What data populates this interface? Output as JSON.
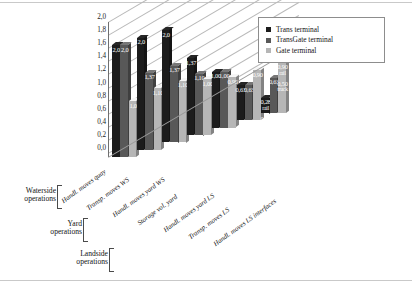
{
  "chart_data": {
    "type": "bar",
    "title": "",
    "xlabel": "",
    "ylabel": "",
    "ylim": [
      0.0,
      2.0
    ],
    "ytick_labels": [
      "2,0",
      "1,8",
      "1,6",
      "1,4",
      "1,2",
      "1,0",
      "0,8",
      "0,6",
      "0,4",
      "0,2",
      "0,0"
    ],
    "ytick_values": [
      2.0,
      1.8,
      1.6,
      1.4,
      1.2,
      1.0,
      0.8,
      0.6,
      0.4,
      0.2,
      0.0
    ],
    "grid": true,
    "legend_position": "top-right",
    "categories": [
      "Handl. moves quay",
      "Transp. moves WS",
      "Handl. moves yard WS",
      "Storage vol. yard",
      "Handl. moves yard LS",
      "Transp. moves LS",
      "Handl. moves LS interfaces"
    ],
    "series": [
      {
        "name": "Trans terminal",
        "color": "#1c1c1c",
        "values": [
          2.0,
          2.0,
          2.0,
          1.37,
          1.0,
          0.63,
          0.28
        ],
        "labels": [
          "2,0",
          "2,0",
          "2,0",
          "1,37",
          "1,00",
          "0,63",
          "0,28"
        ],
        "sublabels": [
          "",
          "",
          "",
          "",
          "",
          "",
          "rail"
        ],
        "extra_labels": [
          "",
          "",
          "",
          "",
          "",
          "",
          "0,55"
        ],
        "extra_sublabels": [
          "",
          "",
          "",
          "",
          "",
          "",
          "truck"
        ]
      },
      {
        "name": "TransGate terminal",
        "color": "#585858",
        "values": [
          2.0,
          1.37,
          1.37,
          1.1,
          1.0,
          0.63,
          0.63
        ],
        "labels": [
          "2,0",
          "1,37",
          "1,37",
          "1,10",
          "1,00",
          "0,63",
          "0,63"
        ],
        "sublabels": [
          "",
          "",
          "",
          "",
          "",
          "",
          ""
        ],
        "extra_labels": [
          "",
          "",
          "",
          "",
          "",
          "",
          ""
        ],
        "extra_sublabels": [
          "",
          "",
          "",
          "",
          "",
          "",
          ""
        ]
      },
      {
        "name": "Gate terminal",
        "color": "#b6b6b6",
        "values": [
          1.0,
          1.1,
          1.1,
          1.0,
          0.9,
          0.9,
          0.9
        ],
        "labels": [
          "1,0",
          "1,10",
          "1,10",
          "1,00",
          "0,90",
          "0,90",
          "0,90"
        ],
        "sublabels": [
          "",
          "",
          "",
          "",
          "",
          "",
          "rail"
        ],
        "extra_labels": [
          "",
          "",
          "",
          "",
          "",
          "",
          "0,50"
        ],
        "extra_sublabels": [
          "",
          "",
          "",
          "",
          "",
          "",
          "truck"
        ]
      }
    ],
    "groups": [
      {
        "name_line1": "Waterside",
        "name_line2": "operations",
        "categories": [
          "Handl. moves quay",
          "Transp. moves WS"
        ]
      },
      {
        "name_line1": "Yard",
        "name_line2": "operations",
        "categories": [
          "Handl. moves yard WS",
          "Storage vol. yard"
        ]
      },
      {
        "name_line1": "Landside",
        "name_line2": "operations",
        "categories": [
          "Handl. moves yard LS",
          "Transp. moves LS",
          "Handl. moves LS interfaces"
        ]
      }
    ]
  }
}
